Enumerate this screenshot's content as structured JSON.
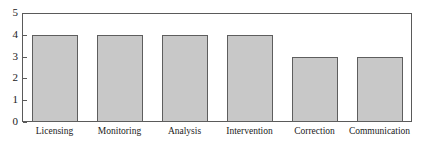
{
  "chart_data": {
    "type": "bar",
    "title": "",
    "subtitle": "",
    "xlabel": "",
    "ylabel": "",
    "categories": [
      "Licensing",
      "Monitoring",
      "Analysis",
      "Intervention",
      "Correction",
      "Communication"
    ],
    "values": [
      4,
      4,
      4,
      4,
      3,
      3
    ],
    "ylim": [
      0,
      5
    ],
    "y_ticks": [
      "0",
      "1",
      "2",
      "3",
      "4",
      "5"
    ],
    "grid": false,
    "legend": null,
    "annotations": [],
    "orientation": "vertical",
    "colors": {
      "bar_fill": "#c8c8c8",
      "bar_stroke": "#5e5e5e",
      "axis": "#5a5a5a",
      "text": "#1a1a1a",
      "background": "#ffffff"
    }
  }
}
